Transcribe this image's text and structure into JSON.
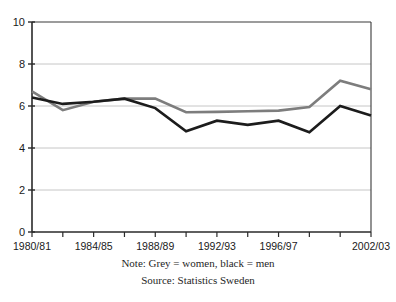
{
  "chart_data": {
    "type": "line",
    "title": "",
    "subtitle": "",
    "xlabel": "",
    "ylabel": "",
    "grid": true,
    "legend_position": "none",
    "ylim": [
      0,
      10
    ],
    "yticks": [
      0,
      2,
      4,
      6,
      8,
      10
    ],
    "ytick_labels": [
      "0",
      "2",
      "4",
      "6",
      "8",
      "10"
    ],
    "x": [
      "1980/81",
      "1982/83",
      "1984/85",
      "1986/87",
      "1988/89",
      "1990/91",
      "1992/93",
      "1994/95",
      "1996/97",
      "1998/99",
      "2000/01",
      "2002/03"
    ],
    "xtick_labels_shown": [
      "1980/81",
      "1984/85",
      "1988/89",
      "1992/93",
      "1996/97",
      "2002/03"
    ],
    "xtick_label_indices": [
      0,
      2,
      4,
      6,
      8,
      11
    ],
    "n_ticks": 12,
    "series": [
      {
        "name": "women",
        "color": "#7d7d7d",
        "stroke_width": 2.6,
        "values": [
          6.7,
          5.8,
          6.2,
          6.35,
          6.35,
          5.7,
          5.72,
          5.75,
          5.78,
          5.95,
          7.2,
          6.8
        ]
      },
      {
        "name": "men",
        "color": "#1c1c1c",
        "stroke_width": 2.6,
        "values": [
          6.4,
          6.1,
          6.2,
          6.35,
          5.9,
          4.8,
          5.3,
          5.1,
          5.3,
          4.75,
          6.0,
          5.55
        ]
      }
    ]
  },
  "caption": {
    "note": "Note: Grey = women, black = men",
    "source": "Source: Statistics Sweden"
  },
  "colors": {
    "women_line": "#7d7d7d",
    "men_line": "#1c1c1c",
    "axis": "#2a2a2a",
    "grid": "#b8b8b8",
    "background": "#ffffff"
  }
}
